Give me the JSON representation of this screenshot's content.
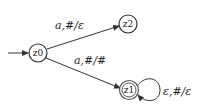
{
  "diagram": {
    "type": "pushdown-automaton",
    "states": [
      {
        "id": "z0",
        "label": "z0",
        "start": true,
        "accept": false
      },
      {
        "id": "z1",
        "label": "z1",
        "start": false,
        "accept": true
      },
      {
        "id": "z2",
        "label": "z2",
        "start": false,
        "accept": false
      }
    ],
    "transitions": [
      {
        "from": "z0",
        "to": "z2",
        "label": "a,#/ε"
      },
      {
        "from": "z0",
        "to": "z1",
        "label": "a,#/#"
      },
      {
        "from": "z1",
        "to": "z1",
        "label": "ε,#/ε"
      }
    ],
    "colors": {
      "stroke": "#333333",
      "background": "#ffffff"
    }
  }
}
